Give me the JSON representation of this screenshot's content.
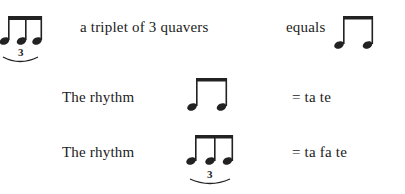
{
  "row1": {
    "text": "a triplet of 3 quavers",
    "equals_label": "equals",
    "left_notation": {
      "type": "triplet-quavers",
      "notes": 3,
      "tuplet_number": "3"
    },
    "right_notation": {
      "type": "two-quavers",
      "notes": 2
    }
  },
  "row2": {
    "label": "The rhythm",
    "notation": {
      "type": "two-quavers",
      "notes": 2
    },
    "result": "= ta te"
  },
  "row3": {
    "label": "The rhythm",
    "notation": {
      "type": "triplet-quavers",
      "notes": 3,
      "tuplet_number": "3"
    },
    "result": "= ta fa te"
  },
  "colors": {
    "ink": "#222222",
    "background": "#ffffff"
  }
}
